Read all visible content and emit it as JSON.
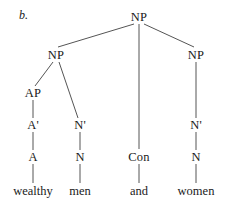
{
  "figure": {
    "label": "b.",
    "background_color": "#ffffff",
    "ink_color": "#1a1a1a",
    "line_color": "#555555"
  },
  "tree": {
    "nodes": [
      {
        "id": "np-top",
        "label": "NP",
        "x": 139,
        "y": 17
      },
      {
        "id": "np-left",
        "label": "NP",
        "x": 56,
        "y": 55
      },
      {
        "id": "np-right",
        "label": "NP",
        "x": 196,
        "y": 55
      },
      {
        "id": "ap",
        "label": "AP",
        "x": 33,
        "y": 93
      },
      {
        "id": "a-bar",
        "label": "A'",
        "x": 33,
        "y": 125
      },
      {
        "id": "a",
        "label": "A",
        "x": 33,
        "y": 157
      },
      {
        "id": "n-bar-mid",
        "label": "N'",
        "x": 80,
        "y": 125
      },
      {
        "id": "n-mid",
        "label": "N",
        "x": 80,
        "y": 157
      },
      {
        "id": "con",
        "label": "Con",
        "x": 139,
        "y": 157
      },
      {
        "id": "n-bar-rt",
        "label": "N'",
        "x": 196,
        "y": 125
      },
      {
        "id": "n-rt",
        "label": "N",
        "x": 196,
        "y": 157
      }
    ],
    "leaves": [
      {
        "id": "leaf-wealthy",
        "label": "wealthy",
        "x": 33,
        "y": 191
      },
      {
        "id": "leaf-men",
        "label": "men",
        "x": 80,
        "y": 191
      },
      {
        "id": "leaf-and",
        "label": "and",
        "x": 139,
        "y": 191
      },
      {
        "id": "leaf-women",
        "label": "women",
        "x": 196,
        "y": 191
      }
    ],
    "edges": [
      {
        "id": "edge-nptop-npleft",
        "x1": 134,
        "y1": 24,
        "x2": 58,
        "y2": 47
      },
      {
        "id": "edge-nptop-con",
        "x1": 139,
        "y1": 24,
        "x2": 139,
        "y2": 149
      },
      {
        "id": "edge-nptop-npright",
        "x1": 144,
        "y1": 24,
        "x2": 194,
        "y2": 47
      },
      {
        "id": "edge-npleft-ap",
        "x1": 53,
        "y1": 62,
        "x2": 35,
        "y2": 86
      },
      {
        "id": "edge-npleft-nbar",
        "x1": 59,
        "y1": 62,
        "x2": 78,
        "y2": 118
      },
      {
        "id": "edge-ap-abar",
        "x1": 33,
        "y1": 100,
        "x2": 33,
        "y2": 118
      },
      {
        "id": "edge-abar-a",
        "x1": 33,
        "y1": 132,
        "x2": 33,
        "y2": 150
      },
      {
        "id": "edge-a-wealthy",
        "x1": 33,
        "y1": 164,
        "x2": 33,
        "y2": 183
      },
      {
        "id": "edge-nbarmid-nmid",
        "x1": 80,
        "y1": 132,
        "x2": 80,
        "y2": 150
      },
      {
        "id": "edge-nmid-men",
        "x1": 80,
        "y1": 164,
        "x2": 80,
        "y2": 183
      },
      {
        "id": "edge-con-and",
        "x1": 139,
        "y1": 164,
        "x2": 139,
        "y2": 183
      },
      {
        "id": "edge-npright-nbar",
        "x1": 196,
        "y1": 62,
        "x2": 196,
        "y2": 118
      },
      {
        "id": "edge-nbarrt-nrt",
        "x1": 196,
        "y1": 132,
        "x2": 196,
        "y2": 150
      },
      {
        "id": "edge-nrt-women",
        "x1": 196,
        "y1": 164,
        "x2": 196,
        "y2": 183
      }
    ]
  }
}
